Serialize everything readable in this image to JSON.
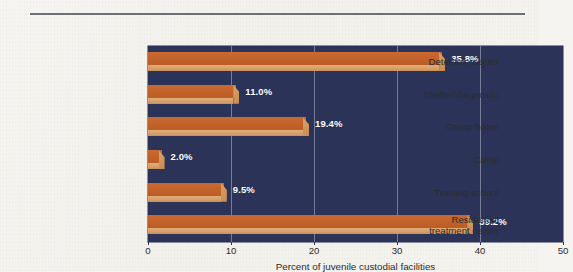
{
  "chart_data": {
    "type": "bar",
    "orientation": "horizontal",
    "title": "",
    "subtitle": "",
    "xlabel": "Percent of juvenile custodial facilities",
    "ylabel": "",
    "xlim": [
      0,
      50
    ],
    "xticks": [
      "0",
      "10",
      "20",
      "30",
      "40",
      "50"
    ],
    "xtick_values": [
      0,
      10,
      20,
      30,
      40,
      50
    ],
    "grid": true,
    "gridlines_at": [
      10,
      20,
      30,
      40
    ],
    "legend": "none",
    "categories": [
      "Detention center",
      "Shelter/diagnostic",
      "Group home",
      "Camp",
      "Training school",
      "Residential\ntreatment center"
    ],
    "values": [
      35.8,
      11.0,
      19.4,
      2.0,
      9.5,
      39.2
    ],
    "data_labels": [
      "35.8%",
      "11.0%",
      "19.4%",
      "2.0%",
      "9.5%",
      "39.2%"
    ],
    "series": [
      {
        "name": "Percent of juvenile custodial facilities",
        "values": [
          35.8,
          11.0,
          19.4,
          2.0,
          9.5,
          39.2
        ]
      }
    ],
    "colors": {
      "bar_top": "#c3612a",
      "bar_bevel": "#d79f68",
      "plot_background": "#2b3458",
      "page_background": "#f6f4f0",
      "gridline": "#9fa5b8",
      "data_label_text": "#ffffff",
      "axis_text": "#2c2c2c",
      "rule": "#6b6f78"
    }
  }
}
